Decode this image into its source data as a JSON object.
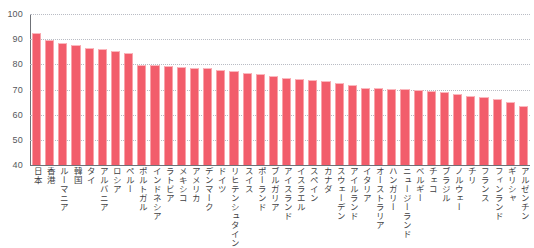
{
  "chart": {
    "title": "",
    "axis": {
      "y_ticks": [
        100,
        90,
        80,
        70,
        60,
        50,
        40
      ],
      "ylim": [
        40,
        100
      ]
    }
  },
  "chart_data": {
    "type": "bar",
    "title": "",
    "subtitle": "",
    "xlabel": "",
    "ylabel": "",
    "ylim": [
      40,
      100
    ],
    "yticks": [
      40,
      50,
      60,
      70,
      80,
      90,
      100
    ],
    "grid": true,
    "legend": "none",
    "orientation": "vertical",
    "bar_color": "#f25d6b",
    "categories": [
      "日本",
      "香港",
      "ルーマニア",
      "韓国",
      "タイ",
      "アルバニア",
      "ロシア",
      "ペルー",
      "ポルトガル",
      "インドネシア",
      "ラトビア",
      "メキシコ",
      "アメリカ",
      "デンマーク",
      "ドイツ",
      "リヒテンシュタイン",
      "スイス",
      "ポーランド",
      "ブルガリア",
      "アイスランド",
      "イスラエル",
      "スペイン",
      "カナダ",
      "スウェーデン",
      "アイルランド",
      "イタリア",
      "オーストラリア",
      "ハンガリー",
      "ニュージーランド",
      "ベルギー",
      "チェコ",
      "ブラジル",
      "ノルウェー",
      "チリ",
      "フランス",
      "フィンランド",
      "ギリシャ",
      "アルゼンチン"
    ],
    "values": [
      92.4,
      89.6,
      88.6,
      87.8,
      86.4,
      86.2,
      85.4,
      84.6,
      79.6,
      79.6,
      79.2,
      79.0,
      78.6,
      78.4,
      77.8,
      77.4,
      76.6,
      76.0,
      75.4,
      74.6,
      74.2,
      73.8,
      73.4,
      72.6,
      71.8,
      70.8,
      70.6,
      70.4,
      70.2,
      70.0,
      69.6,
      69.2,
      68.4,
      67.6,
      67.0,
      66.2,
      65.2,
      63.6
    ]
  },
  "colors": {
    "bar": "#f25d6b",
    "bar_edge": "#f9a3aa",
    "grid": "#b9bcc4",
    "axis": "#6f7177",
    "text": "#3f3f43"
  }
}
